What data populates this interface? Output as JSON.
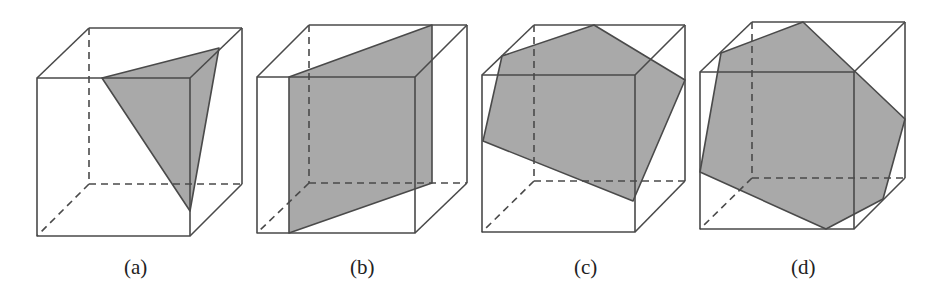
{
  "figure": {
    "fill_color": "#a9a9a9",
    "edge_color": "#4a4a4a",
    "panels": [
      {
        "id": "a",
        "label": "(a)",
        "section_shape": "triangle"
      },
      {
        "id": "b",
        "label": "(b)",
        "section_shape": "rectangle"
      },
      {
        "id": "c",
        "label": "(c)",
        "section_shape": "pentagon"
      },
      {
        "id": "d",
        "label": "(d)",
        "section_shape": "hexagon"
      }
    ]
  }
}
